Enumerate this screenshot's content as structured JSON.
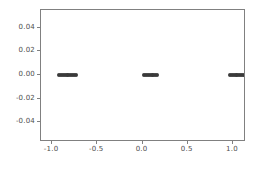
{
  "figure": {
    "width": 259,
    "height": 169,
    "background": "#ffffff",
    "axes_edge_color": "#808080",
    "tick_label_color": "#4d4d4d"
  },
  "chart_data": {
    "type": "scatter",
    "title": "",
    "xlabel": "",
    "ylabel": "",
    "grid": false,
    "legend": null,
    "marker_color": "#3a3a3a",
    "marker_size": 4,
    "xlim": [
      -1.1225,
      1.1225
    ],
    "ylim": [
      -0.055,
      0.055
    ],
    "xticks": [
      -1.0,
      -0.5,
      0.0,
      0.5,
      1.0
    ],
    "xticklabels": [
      "-1.0",
      "-0.5",
      "0.0",
      "0.5",
      "1.0"
    ],
    "yticks": [
      -0.04,
      -0.02,
      0.0,
      0.02,
      0.04
    ],
    "yticklabels": [
      "-0.04",
      "-0.02",
      "0.00",
      "0.02",
      "0.04"
    ],
    "series": [
      {
        "name": "cluster-left",
        "x": [
          -0.92,
          -0.9,
          -0.88,
          -0.86,
          -0.84,
          -0.82,
          -0.8,
          -0.78,
          -0.76,
          -0.74
        ],
        "y": [
          0.0,
          0.0,
          0.0,
          0.0,
          0.0,
          0.0,
          0.0,
          0.0,
          0.0,
          0.0
        ]
      },
      {
        "name": "cluster-center",
        "x": [
          0.02,
          0.04,
          0.06,
          0.08,
          0.1,
          0.12,
          0.14,
          0.16
        ],
        "y": [
          0.0,
          0.0,
          0.0,
          0.0,
          0.0,
          0.0,
          0.0,
          0.0
        ]
      },
      {
        "name": "cluster-right",
        "x": [
          0.97,
          0.99,
          1.01,
          1.03,
          1.05,
          1.07,
          1.09,
          1.11
        ],
        "y": [
          0.0,
          0.0,
          0.0,
          0.0,
          0.0,
          0.0,
          0.0,
          0.0
        ]
      }
    ]
  }
}
